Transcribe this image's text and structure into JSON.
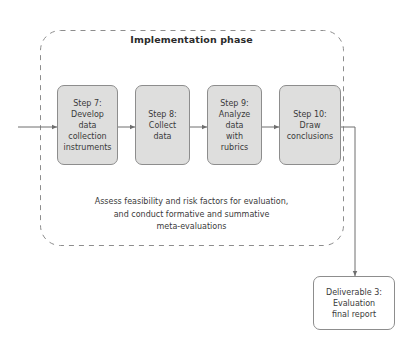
{
  "diagram": {
    "phase": {
      "title": "Implementation phase",
      "note": "Assess feasibility and risk factors for evaluation,\nand conduct formative and summative\nmeta-evaluations"
    },
    "steps": [
      {
        "id": "step-7",
        "label": "Step 7:\nDevelop\ndata\ncollection\ninstruments"
      },
      {
        "id": "step-8",
        "label": "Step 8:\nCollect\ndata"
      },
      {
        "id": "step-9",
        "label": "Step 9:\nAnalyze\ndata\nwith\nrubrics"
      },
      {
        "id": "step-10",
        "label": "Step 10:\nDraw\nconclusions"
      }
    ],
    "deliverable": {
      "label": "Deliverable 3:\nEvaluation\nfinal report"
    },
    "colors": {
      "step_fill": "#dededd",
      "step_border": "#8d8d8d",
      "deliverable_fill": "#ffffff",
      "connector": "#6e6e6e",
      "phase_border": "#8d8d8d",
      "text": "#3a3a3a"
    }
  }
}
